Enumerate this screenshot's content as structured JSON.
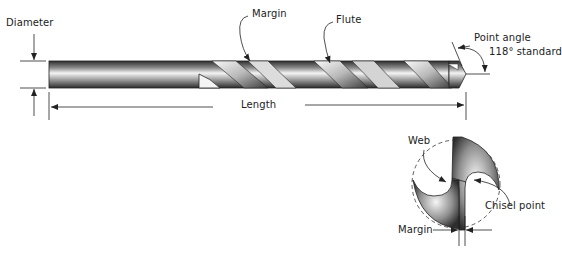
{
  "diagram": {
    "labels": {
      "diameter": "Diameter",
      "margin_top": "Margin",
      "flute": "Flute",
      "point_angle": "Point angle",
      "point_angle_value": "118° standard",
      "length": "Length",
      "web": "Web",
      "chisel_point": "Chisel point",
      "margin_bottom": "Margin"
    },
    "views": [
      {
        "name": "side-view",
        "parts": [
          "shank",
          "flutes",
          "margin",
          "point"
        ]
      },
      {
        "name": "end-view",
        "parts": [
          "web",
          "chisel-point",
          "margin"
        ]
      }
    ],
    "colors": {
      "line": "#222222",
      "metal_dark": "#3a3a3a",
      "metal_light": "#f2f2f2"
    }
  }
}
